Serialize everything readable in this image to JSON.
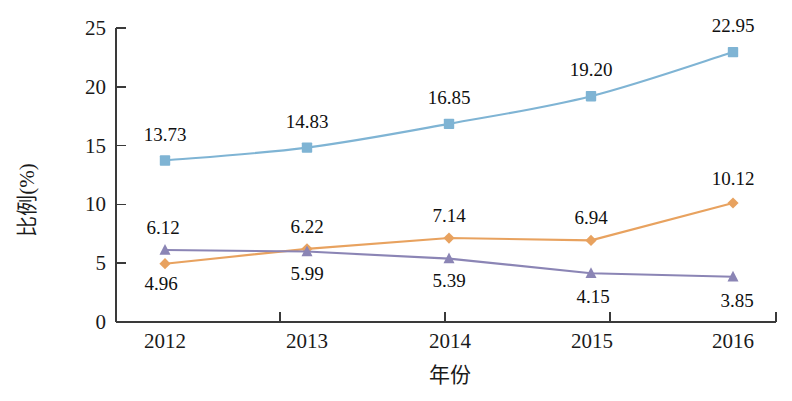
{
  "chart_data": {
    "type": "line",
    "title": "",
    "xlabel": "年份",
    "ylabel": "比例(%)",
    "categories": [
      "2012",
      "2013",
      "2014",
      "2015",
      "2016"
    ],
    "x": [
      2012,
      2013,
      2014,
      2015,
      2016
    ],
    "ylim": [
      0,
      25
    ],
    "yticks": [
      0,
      5,
      10,
      15,
      20,
      25
    ],
    "ytick_labels": [
      "0",
      "5",
      "10",
      "15",
      "20",
      "25"
    ],
    "grid": false,
    "legend": "none",
    "series": [
      {
        "name": "series-blue",
        "color": "#7FB4D4",
        "marker": "square",
        "values": [
          13.73,
          14.83,
          16.85,
          19.2,
          22.95
        ],
        "labels": [
          "13.73",
          "14.83",
          "16.85",
          "19.20",
          "22.95"
        ],
        "label_position": "above"
      },
      {
        "name": "series-orange",
        "color": "#E8A25F",
        "marker": "diamond",
        "values": [
          4.96,
          6.22,
          7.14,
          6.94,
          10.12
        ],
        "labels": [
          "4.96",
          "6.22",
          "7.14",
          "6.94",
          "10.12"
        ],
        "label_position": "mixed"
      },
      {
        "name": "series-purple",
        "color": "#8B85B5",
        "marker": "triangle",
        "values": [
          6.12,
          5.99,
          5.39,
          4.15,
          3.85
        ],
        "labels": [
          "6.12",
          "5.99",
          "5.39",
          "4.15",
          "3.85"
        ],
        "label_position": "mixed"
      }
    ],
    "annotations": {
      "blue_labels": [
        "13.73",
        "14.83",
        "16.85",
        "19.20",
        "22.95"
      ],
      "orange_labels": [
        "4.96",
        "6.22",
        "7.14",
        "6.94",
        "10.12"
      ],
      "purple_labels": [
        "6.12",
        "5.99",
        "5.39",
        "4.15",
        "3.85"
      ]
    }
  },
  "axes": {
    "y_title": "比例(%)",
    "x_title": "年份",
    "y_ticks": [
      "25",
      "20",
      "15",
      "10",
      "5",
      "0"
    ],
    "x_ticks": [
      "2012",
      "2013",
      "2014",
      "2015",
      "2016"
    ]
  }
}
